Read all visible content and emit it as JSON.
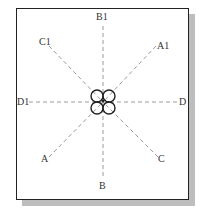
{
  "diagram": {
    "labels": {
      "b1": "B1",
      "c1": "C1",
      "a1": "A1",
      "d1": "D1",
      "d": "D",
      "a": "A",
      "c": "C",
      "b": "B"
    },
    "colors": {
      "frame": "#222222",
      "shadow": "#bdbdbd",
      "dashed_lines": "#9a9a9a",
      "circles": "#222222"
    },
    "center_circles": 4
  }
}
